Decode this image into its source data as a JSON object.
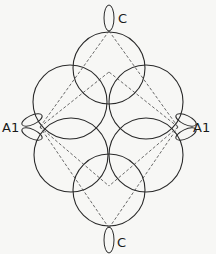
{
  "diagram": {
    "labels": {
      "top": "C",
      "bottom": "C",
      "left": "A1",
      "right": "A1"
    },
    "colors": {
      "background": "#f7f7f5",
      "stroke": "#2a2a2a"
    },
    "circles": [
      {
        "name": "top-circle",
        "cx": 109,
        "cy": 68,
        "r": 36
      },
      {
        "name": "upper-left-circle",
        "cx": 70,
        "cy": 102,
        "r": 37
      },
      {
        "name": "upper-right-circle",
        "cx": 146,
        "cy": 102,
        "r": 37
      },
      {
        "name": "lower-left-circle",
        "cx": 71,
        "cy": 155,
        "r": 37
      },
      {
        "name": "lower-right-circle",
        "cx": 146,
        "cy": 155,
        "r": 37
      },
      {
        "name": "bottom-circle",
        "cx": 109,
        "cy": 190,
        "r": 36
      }
    ]
  }
}
